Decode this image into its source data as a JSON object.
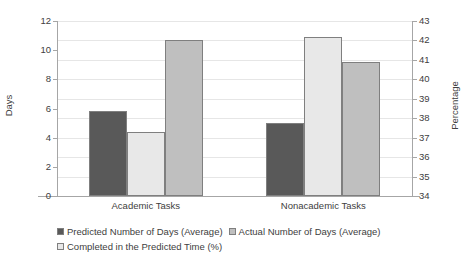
{
  "chart_data": {
    "type": "bar",
    "title": "",
    "subtitle": "",
    "categories": [
      "Academic Tasks",
      "Nonacademic Tasks"
    ],
    "series": [
      {
        "name": "Predicted Number of Days (Average)",
        "axis": "left",
        "color": "#595959",
        "border_color": "#7f7f7f",
        "values": [
          5.8,
          5.0
        ]
      },
      {
        "name": "Actual Number of Days (Average)",
        "axis": "left",
        "color": "#bfbfbf",
        "border_color": "#7f7f7f",
        "values": [
          10.7,
          9.2
        ]
      },
      {
        "name": "Completed in the Predicted Time (%)",
        "axis": "right",
        "color": "#e8e8e8",
        "border_color": "#7f7f7f",
        "values": [
          37.3,
          42.2
        ]
      }
    ],
    "series_draw_order": [
      0,
      2,
      1
    ],
    "xlabel": "",
    "ylabel": "Days",
    "y2label": "Percentage",
    "ylim": [
      0,
      12
    ],
    "yticks": [
      "0",
      "2",
      "4",
      "6",
      "8",
      "10",
      "12"
    ],
    "y2lim": [
      34,
      43
    ],
    "y2ticks": [
      "34",
      "35",
      "36",
      "37",
      "38",
      "39",
      "40",
      "41",
      "42",
      "43"
    ],
    "grid": true,
    "grid_color": "#e6e6e6",
    "legend_position": "bottom-left",
    "legend_entries": [
      "Predicted Number of Days (Average)",
      "Actual Number of Days (Average)",
      "Completed in the Predicted Time (%)"
    ]
  }
}
